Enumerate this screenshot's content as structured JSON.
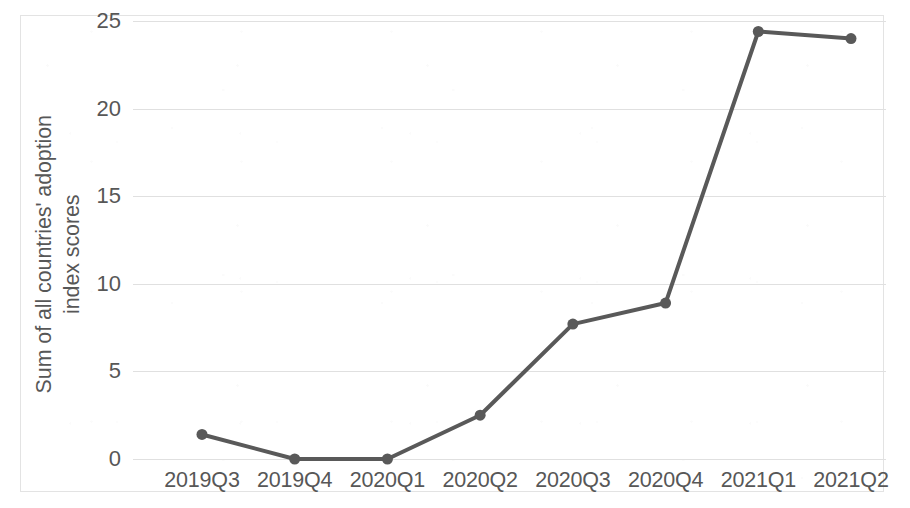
{
  "chart_data": {
    "type": "line",
    "title": "",
    "subtitle": "",
    "xlabel": "",
    "ylabel_lines": [
      "Sum of all countries' adoption",
      "index scores"
    ],
    "ylabel": "Sum of all countries' adoption index scores",
    "categories": [
      "2019Q3",
      "2019Q4",
      "2020Q1",
      "2020Q2",
      "2020Q3",
      "2020Q4",
      "2021Q1",
      "2021Q2"
    ],
    "values": [
      1.4,
      0.0,
      0.0,
      2.5,
      7.7,
      8.9,
      24.4,
      24.0
    ],
    "series": [
      {
        "name": "Sum of all countries' adoption index scores",
        "values": [
          1.4,
          0.0,
          0.0,
          2.5,
          7.7,
          8.9,
          24.4,
          24.0
        ]
      }
    ],
    "ylim": [
      0,
      25
    ],
    "yticks": [
      0,
      5,
      10,
      15,
      20,
      25
    ],
    "ytick_labels": [
      "0",
      "5",
      "10",
      "15",
      "20",
      "25"
    ],
    "grid": "horizontal",
    "legend": "none",
    "line_color": "#595959",
    "marker_color": "#595959",
    "gridline_color": "#e0e0e0",
    "text_color": "#575757",
    "background_color": "#ffffff",
    "border_color": "#e3e3e3",
    "marker": "circle",
    "line_width": 4,
    "marker_size": 11
  }
}
